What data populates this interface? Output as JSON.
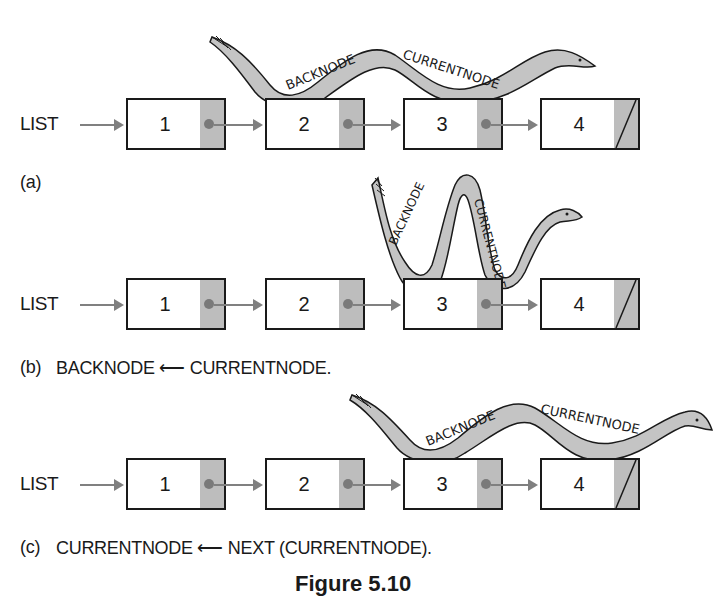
{
  "figure": {
    "caption": "Figure 5.10",
    "panels": [
      {
        "id": "a",
        "label": "(a)",
        "list_label": "LIST",
        "nodes": [
          "1",
          "2",
          "3",
          "4"
        ],
        "null_terminated_node": "4",
        "worm": {
          "text_back": "BACKNODE",
          "text_current": "CURRENTNODE",
          "back_at_node": "2",
          "current_at_node": "3"
        }
      },
      {
        "id": "b",
        "label": "(b)",
        "statement": "BACKNODE ⟵ CURRENTNODE.",
        "list_label": "LIST",
        "nodes": [
          "1",
          "2",
          "3",
          "4"
        ],
        "worm": {
          "text_back": "BACKNODE",
          "text_current": "CURRENTNODE",
          "back_at_node": "3",
          "current_at_node": "3"
        }
      },
      {
        "id": "c",
        "label": "(c)",
        "statement": "CURRENTNODE ⟵ NEXT (CURRENTNODE).",
        "list_label": "LIST",
        "nodes": [
          "1",
          "2",
          "3",
          "4"
        ],
        "worm": {
          "text_back": "BACKNODE",
          "text_current": "CURRENTNODE",
          "back_at_node": "3",
          "current_at_node": "4"
        }
      }
    ],
    "colors": {
      "pointer_cell": "#bdbdbd",
      "worm_fill": "#c4c4c4",
      "arrow": "#808080",
      "outline": "#1a1a1a"
    }
  }
}
